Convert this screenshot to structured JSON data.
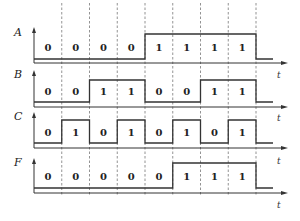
{
  "diagram": {
    "title": "",
    "time_axis_label": "t",
    "num_intervals": 8,
    "signals": [
      {
        "name": "A",
        "values": [
          0,
          0,
          0,
          0,
          1,
          1,
          1,
          1
        ]
      },
      {
        "name": "B",
        "values": [
          0,
          0,
          1,
          1,
          0,
          0,
          1,
          1
        ]
      },
      {
        "name": "C",
        "values": [
          0,
          1,
          0,
          1,
          0,
          1,
          0,
          1
        ]
      },
      {
        "name": "F",
        "values": [
          0,
          0,
          0,
          0,
          0,
          1,
          1,
          1
        ]
      }
    ]
  },
  "layout": {
    "x0": 34,
    "interval_width": 27.75,
    "tail_length": 17,
    "arrow_end": 288,
    "rows": [
      {
        "label_y": 36,
        "arrow_top": 27,
        "high_y": 34,
        "low_y": 59,
        "axis_y": 63,
        "t_y": 78
      },
      {
        "label_y": 78,
        "arrow_top": 70,
        "high_y": 80,
        "low_y": 102,
        "axis_y": 107,
        "t_y": 121
      },
      {
        "label_y": 120,
        "arrow_top": 112,
        "high_y": 120,
        "low_y": 143,
        "axis_y": 148,
        "t_y": 164
      },
      {
        "label_y": 166,
        "arrow_top": 158,
        "high_y": 163,
        "low_y": 188,
        "axis_y": 193,
        "t_y": 208
      }
    ],
    "grid_top": 3,
    "grid_bottom": 196,
    "colors": {
      "line": "#333333",
      "grid": "#777777",
      "text": "#222222"
    }
  }
}
